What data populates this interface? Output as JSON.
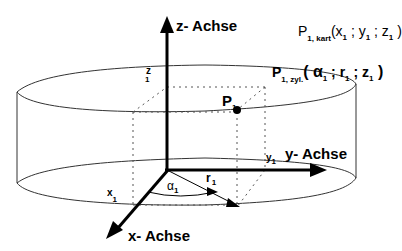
{
  "diagram": {
    "axes": {
      "z": "z- Achse",
      "y": "y- Achse",
      "x": "x- Achse"
    },
    "point": {
      "name": "P",
      "sub": "1"
    },
    "coord_labels": {
      "x1": {
        "base": "x",
        "sub": "1"
      },
      "y1": {
        "base": "y",
        "sub": "1"
      },
      "z1": {
        "base": "z",
        "sub": "1"
      },
      "r1": {
        "base": "r",
        "sub": "1"
      },
      "alpha1": {
        "base": "α",
        "sub": "1"
      }
    },
    "cartesian": {
      "base": "P",
      "sub": "1, kart",
      "open": "(x",
      "s1": "1",
      "sep1": " ; y",
      "s2": "1",
      "sep2": " ; z",
      "s3": "1",
      "close": " )"
    },
    "cylindrical": {
      "base": "P",
      "sub": "1, zyl.",
      "open": "( α",
      "s1": "1",
      "sep1": " ; r",
      "s2": "1",
      "sep2": " ; z",
      "s3": "1",
      "close": " )"
    },
    "colors": {
      "line": "#000000",
      "cylinder": "#333333",
      "dotted": "#555555",
      "background": "#ffffff"
    }
  }
}
